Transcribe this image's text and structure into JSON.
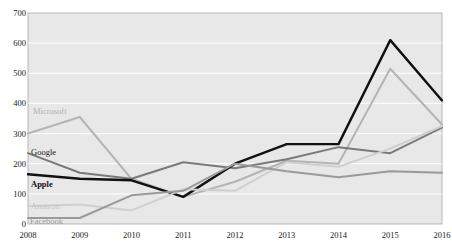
{
  "chart_data": {
    "type": "line",
    "title": "",
    "xlabel": "",
    "ylabel": "",
    "x": [
      2008,
      2009,
      2010,
      2011,
      2012,
      2013,
      2014,
      2015,
      2016
    ],
    "categories": [
      "2008",
      "2009",
      "2010",
      "2011",
      "2012",
      "2013",
      "2014",
      "2015",
      "2016"
    ],
    "ylim": [
      0,
      700
    ],
    "yticks": [
      0,
      100,
      200,
      300,
      400,
      500,
      600,
      700
    ],
    "ytick_labels": [
      "0",
      "100",
      "200",
      "300",
      "400",
      "500",
      "600",
      "700"
    ],
    "grid": "horizontal",
    "legend_position": "inline-left",
    "series": [
      {
        "name": "Microsoft",
        "color": "#b4b4b4",
        "label_color": "#b0b0b0",
        "label_weight": "normal",
        "values": [
          300,
          355,
          150,
          90,
          140,
          210,
          200,
          515,
          330
        ]
      },
      {
        "name": "Google",
        "color": "#7a7a7a",
        "label_color": "#1a1a1a",
        "label_weight": "normal",
        "values": [
          235,
          170,
          150,
          205,
          185,
          215,
          255,
          235,
          320
        ]
      },
      {
        "name": "Apple",
        "color": "#111111",
        "label_color": "#111111",
        "label_weight": "bold",
        "values": [
          165,
          150,
          145,
          90,
          200,
          265,
          265,
          610,
          410
        ]
      },
      {
        "name": "Amazon",
        "color": "#cfcfcf",
        "label_color": "#c4c4c4",
        "label_weight": "normal",
        "values": [
          60,
          65,
          45,
          115,
          110,
          205,
          190,
          250,
          325
        ]
      },
      {
        "name": "Facebook",
        "color": "#9a9a9a",
        "label_color": "#9a9a9a",
        "label_weight": "normal",
        "values": [
          20,
          20,
          95,
          110,
          200,
          175,
          155,
          175,
          170
        ]
      }
    ],
    "series_labels": [
      {
        "name": "Microsoft",
        "x": 33,
        "y": 107
      },
      {
        "name": "Google",
        "x": 31,
        "y": 148
      },
      {
        "name": "Apple",
        "x": 31,
        "y": 180
      },
      {
        "name": "Amazon",
        "x": 31,
        "y": 202
      },
      {
        "name": "Facebook",
        "x": 30,
        "y": 217
      }
    ]
  },
  "axes": {
    "y_ticks": [
      "700",
      "600",
      "500",
      "400",
      "300",
      "200",
      "100",
      "0"
    ],
    "x_ticks": [
      "2008",
      "2009",
      "2010",
      "2011",
      "2012",
      "2013",
      "2014",
      "2015",
      "2016"
    ]
  }
}
